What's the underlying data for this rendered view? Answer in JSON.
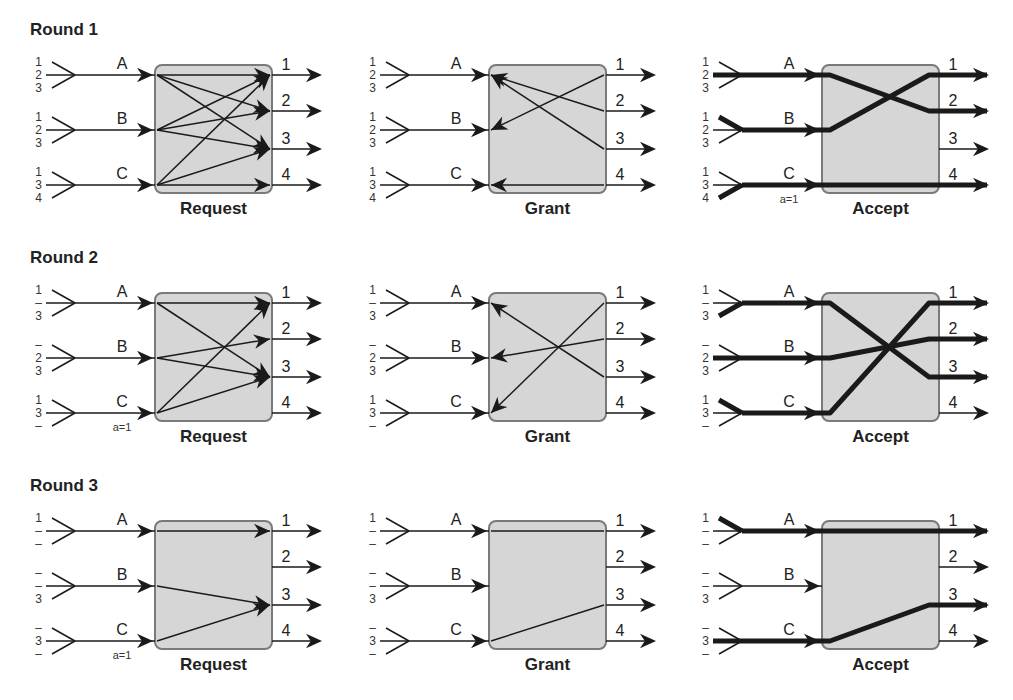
{
  "rounds": [
    {
      "title": "Round 1",
      "inputs": [
        {
          "name": "A",
          "queue": [
            "1",
            "2",
            "3"
          ]
        },
        {
          "name": "B",
          "queue": [
            "1",
            "2",
            "3"
          ]
        },
        {
          "name": "C",
          "queue": [
            "1",
            "3",
            "4"
          ]
        }
      ],
      "outputs": [
        "1",
        "2",
        "3",
        "4"
      ],
      "request": {
        "label": "Request",
        "edges": [
          [
            "A",
            "1"
          ],
          [
            "A",
            "2"
          ],
          [
            "A",
            "3"
          ],
          [
            "B",
            "1"
          ],
          [
            "B",
            "2"
          ],
          [
            "B",
            "3"
          ],
          [
            "C",
            "1"
          ],
          [
            "C",
            "3"
          ],
          [
            "C",
            "4"
          ]
        ],
        "annotation": ""
      },
      "grant": {
        "label": "Grant",
        "edges": [
          [
            "1",
            "B"
          ],
          [
            "2",
            "A"
          ],
          [
            "3",
            "A"
          ],
          [
            "4",
            "C"
          ]
        ]
      },
      "accept": {
        "label": "Accept",
        "edges": [
          [
            "A",
            "2"
          ],
          [
            "B",
            "1"
          ],
          [
            "C",
            "4"
          ]
        ],
        "accepted_queue_index": {
          "A": 1,
          "B": 0,
          "C": 2
        },
        "annotation": "a=1"
      }
    },
    {
      "title": "Round 2",
      "inputs": [
        {
          "name": "A",
          "queue": [
            "1",
            "–",
            "3"
          ]
        },
        {
          "name": "B",
          "queue": [
            "–",
            "2",
            "3"
          ]
        },
        {
          "name": "C",
          "queue": [
            "1",
            "3",
            "–"
          ]
        }
      ],
      "outputs": [
        "1",
        "2",
        "3",
        "4"
      ],
      "request": {
        "label": "Request",
        "edges": [
          [
            "A",
            "1"
          ],
          [
            "A",
            "3"
          ],
          [
            "B",
            "2"
          ],
          [
            "B",
            "3"
          ],
          [
            "C",
            "1"
          ],
          [
            "C",
            "3"
          ]
        ],
        "annotation": "a=1"
      },
      "grant": {
        "label": "Grant",
        "edges": [
          [
            "1",
            "C"
          ],
          [
            "2",
            "B"
          ],
          [
            "3",
            "A"
          ]
        ]
      },
      "accept": {
        "label": "Accept",
        "edges": [
          [
            "A",
            "3"
          ],
          [
            "B",
            "2"
          ],
          [
            "C",
            "1"
          ]
        ],
        "accepted_queue_index": {
          "A": 2,
          "B": 1,
          "C": 0
        },
        "annotation": ""
      }
    },
    {
      "title": "Round 3",
      "inputs": [
        {
          "name": "A",
          "queue": [
            "1",
            "–",
            "–"
          ]
        },
        {
          "name": "B",
          "queue": [
            "–",
            "–",
            "3"
          ]
        },
        {
          "name": "C",
          "queue": [
            "–",
            "3",
            "–"
          ]
        }
      ],
      "outputs": [
        "1",
        "2",
        "3",
        "4"
      ],
      "request": {
        "label": "Request",
        "edges": [
          [
            "A",
            "1"
          ],
          [
            "B",
            "3"
          ],
          [
            "C",
            "3"
          ]
        ],
        "annotation": "a=1"
      },
      "grant": {
        "label": "Grant",
        "edges": [
          [
            "1",
            "A"
          ],
          [
            "3",
            "C"
          ]
        ]
      },
      "accept": {
        "label": "Accept",
        "edges": [
          [
            "A",
            "1"
          ],
          [
            "C",
            "3"
          ]
        ],
        "accepted_queue_index": {
          "A": 0,
          "C": 1
        },
        "annotation": ""
      }
    }
  ],
  "colors": {
    "box_fill": "#d6d6d6",
    "box_stroke": "#7a7a7a",
    "line": "#1a1a1a"
  }
}
